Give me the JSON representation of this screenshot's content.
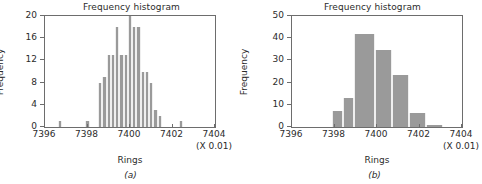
{
  "figure": {
    "panels": [
      {
        "caption": "(a)",
        "title": "Frequency histogram",
        "xlabel": "Rings",
        "ylabel": "Frequency",
        "x_multiplier": "(X 0.01)"
      },
      {
        "caption": "(b)",
        "title": "Frequency histogram",
        "xlabel": "Rings",
        "ylabel": "Frequency",
        "x_multiplier": "(X 0.01)"
      }
    ]
  },
  "chart_data": [
    {
      "type": "bar",
      "title": "Frequency histogram",
      "xlabel": "Rings",
      "ylabel": "Frequency",
      "x_multiplier": "(X 0.01)",
      "caption": "(a)",
      "xlim": [
        7396,
        7404
      ],
      "ylim": [
        0,
        20
      ],
      "x_ticks": [
        7396,
        7398,
        7400,
        7402,
        7404
      ],
      "x_tick_labels": [
        "7396",
        "7398",
        "7400",
        "7402",
        "7404"
      ],
      "y_ticks": [
        0,
        4,
        8,
        12,
        16,
        20
      ],
      "y_tick_labels": [
        "0",
        "4",
        "8",
        "12",
        "16",
        "20"
      ],
      "grid": false,
      "legend": false,
      "bar_color": "#9a9a9a",
      "bin_width": 0.2,
      "bins": [
        {
          "left": 7396.6,
          "right": 7396.8,
          "value": 1
        },
        {
          "left": 7397.9,
          "right": 7398.1,
          "value": 1
        },
        {
          "left": 7398.5,
          "right": 7398.7,
          "value": 8
        },
        {
          "left": 7398.7,
          "right": 7398.9,
          "value": 9
        },
        {
          "left": 7398.9,
          "right": 7399.1,
          "value": 13
        },
        {
          "left": 7399.1,
          "right": 7399.3,
          "value": 13
        },
        {
          "left": 7399.3,
          "right": 7399.5,
          "value": 18
        },
        {
          "left": 7399.5,
          "right": 7399.7,
          "value": 13
        },
        {
          "left": 7399.7,
          "right": 7399.9,
          "value": 13
        },
        {
          "left": 7399.9,
          "right": 7400.1,
          "value": 20
        },
        {
          "left": 7400.1,
          "right": 7400.3,
          "value": 18
        },
        {
          "left": 7400.3,
          "right": 7400.5,
          "value": 18
        },
        {
          "left": 7400.5,
          "right": 7400.7,
          "value": 10
        },
        {
          "left": 7400.7,
          "right": 7400.9,
          "value": 10
        },
        {
          "left": 7400.9,
          "right": 7401.1,
          "value": 8
        },
        {
          "left": 7401.1,
          "right": 7401.3,
          "value": 3
        },
        {
          "left": 7401.3,
          "right": 7401.5,
          "value": 2
        },
        {
          "left": 7402.3,
          "right": 7402.5,
          "value": 1
        }
      ]
    },
    {
      "type": "bar",
      "title": "Frequency histogram",
      "xlabel": "Rings",
      "ylabel": "Frequency",
      "x_multiplier": "(X 0.01)",
      "caption": "(b)",
      "xlim": [
        7396,
        7404
      ],
      "ylim": [
        0,
        50
      ],
      "x_ticks": [
        7396,
        7398,
        7400,
        7402,
        7404
      ],
      "x_tick_labels": [
        "7396",
        "7398",
        "7400",
        "7402",
        "7404"
      ],
      "y_ticks": [
        0,
        10,
        20,
        30,
        40,
        50
      ],
      "y_tick_labels": [
        "0",
        "10",
        "20",
        "30",
        "40",
        "50"
      ],
      "grid": false,
      "legend": false,
      "bar_color": "#9a9a9a",
      "bin_width": 0.5,
      "bins": [
        {
          "left": 7397.9,
          "right": 7398.4,
          "value": 7
        },
        {
          "left": 7398.4,
          "right": 7398.9,
          "value": 13
        },
        {
          "left": 7398.9,
          "right": 7399.9,
          "value": 42
        },
        {
          "left": 7399.9,
          "right": 7400.7,
          "value": 34.5
        },
        {
          "left": 7400.7,
          "right": 7401.5,
          "value": 23.5
        },
        {
          "left": 7401.5,
          "right": 7402.3,
          "value": 6.5
        },
        {
          "left": 7402.3,
          "right": 7403.1,
          "value": 1
        }
      ]
    }
  ]
}
